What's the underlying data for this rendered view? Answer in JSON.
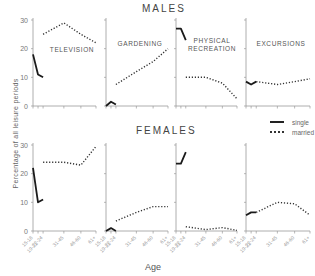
{
  "chart_data": {
    "type": "line",
    "ylabel": "Percentage of all leisure periods",
    "xlabel": "Age",
    "x": [
      "15-18",
      "19-21",
      "22-24",
      "31-45",
      "46-60",
      "61+"
    ],
    "ylim": [
      0,
      30
    ],
    "yticks": [
      0,
      10,
      20,
      30
    ],
    "grid": false,
    "legend": {
      "position": "right-middle",
      "entries": [
        "single",
        "married"
      ]
    },
    "rows": [
      {
        "title": "MALES",
        "panels": [
          {
            "title": "TELEVISION",
            "series": [
              {
                "name": "single",
                "x": [
                  "15-18",
                  "19-21",
                  "22-24"
                ],
                "values": [
                  18,
                  11,
                  10
                ]
              },
              {
                "name": "married",
                "x": [
                  "22-24",
                  "31-45",
                  "46-60",
                  "61+"
                ],
                "values": [
                  25,
                  29,
                  25,
                  22
                ]
              }
            ]
          },
          {
            "title": "GARDENING",
            "series": [
              {
                "name": "single",
                "x": [
                  "15-18",
                  "19-21",
                  "22-24"
                ],
                "values": [
                  0,
                  1.5,
                  0.5
                ]
              },
              {
                "name": "married",
                "x": [
                  "22-24",
                  "31-45",
                  "46-60",
                  "61+"
                ],
                "values": [
                  7.5,
                  12,
                  15.5,
                  20
                ]
              }
            ]
          },
          {
            "title": "PHYSICAL RECREATION",
            "series": [
              {
                "name": "single",
                "x": [
                  "15-18",
                  "19-21",
                  "22-24"
                ],
                "values": [
                  27,
                  27,
                  23
                ]
              },
              {
                "name": "married",
                "x": [
                  "22-24",
                  "31-45",
                  "46-60",
                  "61+"
                ],
                "values": [
                  10,
                  10,
                  8,
                  2.5
                ]
              }
            ]
          },
          {
            "title": "EXCURSIONS",
            "series": [
              {
                "name": "single",
                "x": [
                  "15-18",
                  "19-21",
                  "22-24"
                ],
                "values": [
                  8.5,
                  7.5,
                  8.5
                ]
              },
              {
                "name": "married",
                "x": [
                  "22-24",
                  "31-45",
                  "46-60",
                  "61+"
                ],
                "values": [
                  8.5,
                  7.5,
                  8.5,
                  9.5
                ]
              }
            ]
          }
        ]
      },
      {
        "title": "FEMALES",
        "panels": [
          {
            "title": "TELEVISION",
            "series": [
              {
                "name": "single",
                "x": [
                  "15-18",
                  "19-21",
                  "22-24"
                ],
                "values": [
                  22,
                  10,
                  11
                ]
              },
              {
                "name": "married",
                "x": [
                  "22-24",
                  "31-45",
                  "46-60",
                  "61+"
                ],
                "values": [
                  24,
                  24,
                  23,
                  29.5
                ]
              }
            ]
          },
          {
            "title": "GARDENING",
            "series": [
              {
                "name": "single",
                "x": [
                  "15-18",
                  "19-21",
                  "22-24"
                ],
                "values": [
                  0,
                  1,
                  0
                ]
              },
              {
                "name": "married",
                "x": [
                  "22-24",
                  "31-45",
                  "46-60",
                  "61+"
                ],
                "values": [
                  3.5,
                  6.5,
                  8.5,
                  8.5
                ]
              }
            ]
          },
          {
            "title": "PHYSICAL RECREATION",
            "series": [
              {
                "name": "single",
                "x": [
                  "15-18",
                  "19-21",
                  "22-24"
                ],
                "values": [
                  23.5,
                  23.5,
                  27.5
                ]
              },
              {
                "name": "married",
                "x": [
                  "22-24",
                  "31-45",
                  "46-60",
                  "61+"
                ],
                "values": [
                  1.5,
                  0.5,
                  1.2,
                  0.2
                ]
              }
            ]
          },
          {
            "title": "EXCURSIONS",
            "series": [
              {
                "name": "single",
                "x": [
                  "15-18",
                  "19-21",
                  "22-24"
                ],
                "values": [
                  5.5,
                  6.5,
                  6.5
                ]
              },
              {
                "name": "married",
                "x": [
                  "22-24",
                  "31-45",
                  "46-60",
                  "61+"
                ],
                "values": [
                  6.5,
                  10,
                  9.5,
                  5.5
                ]
              }
            ]
          }
        ]
      }
    ]
  },
  "labels": {
    "males_title": "MALES",
    "females_title": "FEMALES",
    "ylabel": "Percentage of all leisure periods",
    "xlabel": "Age",
    "legend_single": "single",
    "legend_married": "married"
  }
}
